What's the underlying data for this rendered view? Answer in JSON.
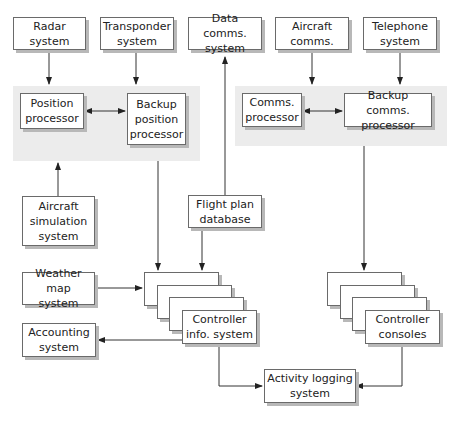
{
  "diagram": {
    "type": "architecture",
    "nodes": {
      "radar": "Radar\nsystem",
      "transponder": "Transponder\nsystem",
      "data_comms": "Data comms.\nsystem",
      "aircraft_comms": "Aircraft\ncomms.",
      "telephone": "Telephone\nsystem",
      "position_processor": "Position\nprocessor",
      "backup_position_processor": "Backup\nposition\nprocessor",
      "comms_processor": "Comms.\nprocessor",
      "backup_comms_processor": "Backup comms.\nprocessor",
      "aircraft_simulation": "Aircraft\nsimulation\nsystem",
      "flight_plan_db": "Flight plan\ndatabase",
      "weather_map": "Weather map\nsystem",
      "accounting": "Accounting\nsystem",
      "controller_info": "Controller\ninfo. system",
      "controller_consoles": "Controller\nconsoles",
      "activity_logging": "Activity logging\nsystem"
    },
    "edges": [
      {
        "from": "radar",
        "to": "position_processor"
      },
      {
        "from": "transponder",
        "to": "backup_position_processor"
      },
      {
        "from": "position_processor",
        "to": "backup_position_processor",
        "bidirectional": true
      },
      {
        "from": "aircraft_comms",
        "to": "comms_processor"
      },
      {
        "from": "telephone",
        "to": "backup_comms_processor"
      },
      {
        "from": "comms_processor",
        "to": "backup_comms_processor",
        "bidirectional": true
      },
      {
        "from": "aircraft_simulation",
        "to": "position_group"
      },
      {
        "from": "flight_plan_db",
        "to": "data_comms"
      },
      {
        "from": "position_group",
        "to": "controller_info"
      },
      {
        "from": "flight_plan_db",
        "to": "controller_info"
      },
      {
        "from": "weather_map",
        "to": "controller_info"
      },
      {
        "from": "controller_info",
        "to": "accounting"
      },
      {
        "from": "comms_group",
        "to": "controller_consoles"
      },
      {
        "from": "controller_info",
        "to": "activity_logging"
      },
      {
        "from": "controller_consoles",
        "to": "activity_logging"
      }
    ]
  }
}
